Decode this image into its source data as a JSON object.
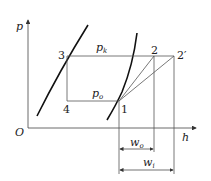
{
  "diagram": {
    "type": "p-h refrigeration cycle",
    "axes": {
      "y_label": "p",
      "x_label": "h",
      "origin_label": "O"
    },
    "points": [
      {
        "id": "1",
        "label": "1"
      },
      {
        "id": "2",
        "label": "2"
      },
      {
        "id": "2p",
        "label": "2′"
      },
      {
        "id": "3",
        "label": "3"
      },
      {
        "id": "4",
        "label": "4"
      }
    ],
    "pressures": {
      "condensing": {
        "symbol": "p",
        "sub": "k"
      },
      "evaporating": {
        "symbol": "p",
        "sub": "o"
      }
    },
    "dimensions": {
      "w0": {
        "symbol": "w",
        "sub": "o"
      },
      "wi": {
        "symbol": "w",
        "sub": "i"
      }
    },
    "colors": {
      "line": "#222222",
      "thin": "#555555"
    }
  }
}
